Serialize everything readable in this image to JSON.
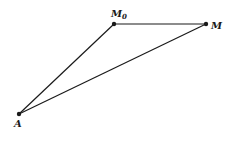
{
  "diagram": {
    "type": "triangle",
    "points": [
      {
        "id": "M0",
        "label": "M",
        "subscript": "0",
        "x": 114,
        "y": 24
      },
      {
        "id": "M",
        "label": "M",
        "subscript": "",
        "x": 206,
        "y": 24
      },
      {
        "id": "A",
        "label": "A",
        "subscript": "",
        "x": 19,
        "y": 114
      }
    ],
    "segments": [
      [
        "A",
        "M0"
      ],
      [
        "M0",
        "M"
      ],
      [
        "A",
        "M"
      ]
    ],
    "colors": {
      "stroke": "#1a1a1a",
      "background": "#ffffff"
    }
  }
}
